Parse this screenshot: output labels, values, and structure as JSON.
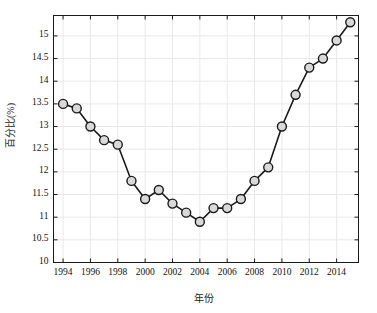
{
  "chart_data": {
    "type": "line",
    "title": "",
    "subtitle": "",
    "xlabel": "年份",
    "ylabel": "百分比(%)",
    "xlim": [
      1993.3,
      2015.6
    ],
    "ylim": [
      10,
      15.45
    ],
    "grid": true,
    "legend": null,
    "marker": {
      "shape": "circle",
      "fill_color": "#d9d9d9",
      "edge_color": "#1a1a1a",
      "size_px": 9
    },
    "line": {
      "color": "#1a1a1a",
      "width_px": 1.6,
      "style": "solid"
    },
    "x": [
      1994,
      1995,
      1996,
      1997,
      1998,
      1999,
      2000,
      2001,
      2002,
      2003,
      2004,
      2005,
      2006,
      2007,
      2008,
      2009,
      2010,
      2011,
      2012,
      2013,
      2014,
      2015
    ],
    "values": [
      13.5,
      13.4,
      13.0,
      12.7,
      12.6,
      11.8,
      11.4,
      11.6,
      11.3,
      11.1,
      10.9,
      11.2,
      11.2,
      11.4,
      11.8,
      12.1,
      13.0,
      13.7,
      14.3,
      14.5,
      14.9,
      15.3
    ],
    "series": [
      {
        "name": "百分比(%)",
        "values": [
          13.5,
          13.4,
          13.0,
          12.7,
          12.6,
          11.8,
          11.4,
          11.6,
          11.3,
          11.1,
          10.9,
          11.2,
          11.2,
          11.4,
          11.8,
          12.1,
          13.0,
          13.7,
          14.3,
          14.5,
          14.9,
          15.3
        ]
      }
    ],
    "xticks": [
      1994,
      1996,
      1998,
      2000,
      2002,
      2004,
      2006,
      2008,
      2010,
      2012,
      2014
    ],
    "xtick_labels": [
      "1994",
      "1996",
      "1998",
      "2000",
      "2002",
      "2004",
      "2006",
      "2008",
      "2010",
      "2012",
      "2014"
    ],
    "yticks": [
      10,
      10.5,
      11,
      11.5,
      12,
      12.5,
      13,
      13.5,
      14,
      14.5,
      15
    ],
    "ytick_labels": [
      "10",
      "10.5",
      "11",
      "11.5",
      "12",
      "12.5",
      "13",
      "13.5",
      "14",
      "14.5",
      "15"
    ],
    "colors": {
      "axis": "#1a1a1a",
      "grid": "#e8e8e8",
      "background": "#ffffff",
      "marker_fill": "#d9d9d9",
      "marker_edge": "#1a1a1a",
      "line": "#1a1a1a"
    }
  }
}
